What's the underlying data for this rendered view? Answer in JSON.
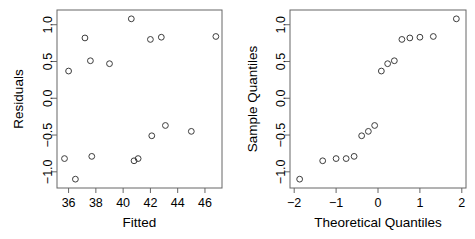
{
  "figure": {
    "kind": "regression-diagnostic-plots",
    "panel_count": 2,
    "background_color": "#ffffff",
    "point_color": "#3c3c3c",
    "axis_color": "#666666"
  },
  "chart_data": [
    {
      "type": "scatter",
      "panel": "left",
      "title": "",
      "xlabel": "Fitted",
      "ylabel": "Residuals",
      "xlim": [
        35.15,
        47.25
      ],
      "ylim": [
        -1.22,
        1.2
      ],
      "xticks": [
        36,
        38,
        40,
        42,
        44,
        46
      ],
      "xtick_labels": [
        "36",
        "38",
        "40",
        "42",
        "44",
        "46"
      ],
      "yticks": [
        -1.0,
        -0.5,
        0.0,
        0.5,
        1.0
      ],
      "ytick_labels": [
        "-1.0",
        "-0.5",
        "0.0",
        "0.5",
        "1.0"
      ],
      "grid": false,
      "legend": false,
      "marker": "open-circle",
      "points": [
        {
          "x": 35.7,
          "y": -0.82
        },
        {
          "x": 36.0,
          "y": 0.37
        },
        {
          "x": 36.5,
          "y": -1.1
        },
        {
          "x": 37.2,
          "y": 0.82
        },
        {
          "x": 37.6,
          "y": 0.51
        },
        {
          "x": 37.7,
          "y": -0.79
        },
        {
          "x": 39.0,
          "y": 0.47
        },
        {
          "x": 40.6,
          "y": 1.08
        },
        {
          "x": 40.8,
          "y": -0.85
        },
        {
          "x": 41.1,
          "y": -0.82
        },
        {
          "x": 42.0,
          "y": 0.8
        },
        {
          "x": 42.1,
          "y": -0.51
        },
        {
          "x": 42.8,
          "y": 0.83
        },
        {
          "x": 43.1,
          "y": -0.37
        },
        {
          "x": 45.0,
          "y": -0.45
        },
        {
          "x": 46.8,
          "y": 0.84
        }
      ]
    },
    {
      "type": "scatter",
      "panel": "right",
      "title": "",
      "xlabel": "Theoretical Quantiles",
      "ylabel": "Sample Quantiles",
      "xlim": [
        -2.1,
        2.1
      ],
      "ylim": [
        -1.22,
        1.2
      ],
      "xticks": [
        -2,
        -1,
        0,
        1,
        2
      ],
      "xtick_labels": [
        "-2",
        "-1",
        "0",
        "1",
        "2"
      ],
      "yticks": [
        -1.0,
        -0.5,
        0.0,
        0.5,
        1.0
      ],
      "ytick_labels": [
        "-1.0",
        "-0.5",
        "0.0",
        "0.5",
        "1.0"
      ],
      "grid": false,
      "legend": false,
      "marker": "open-circle",
      "points": [
        {
          "x": -1.87,
          "y": -1.1
        },
        {
          "x": -1.32,
          "y": -0.85
        },
        {
          "x": -1.0,
          "y": -0.82
        },
        {
          "x": -0.76,
          "y": -0.82
        },
        {
          "x": -0.57,
          "y": -0.79
        },
        {
          "x": -0.39,
          "y": -0.51
        },
        {
          "x": -0.23,
          "y": -0.45
        },
        {
          "x": -0.08,
          "y": -0.37
        },
        {
          "x": 0.08,
          "y": 0.37
        },
        {
          "x": 0.23,
          "y": 0.47
        },
        {
          "x": 0.39,
          "y": 0.51
        },
        {
          "x": 0.57,
          "y": 0.8
        },
        {
          "x": 0.76,
          "y": 0.82
        },
        {
          "x": 1.0,
          "y": 0.83
        },
        {
          "x": 1.32,
          "y": 0.84
        },
        {
          "x": 1.87,
          "y": 1.08
        }
      ]
    }
  ]
}
